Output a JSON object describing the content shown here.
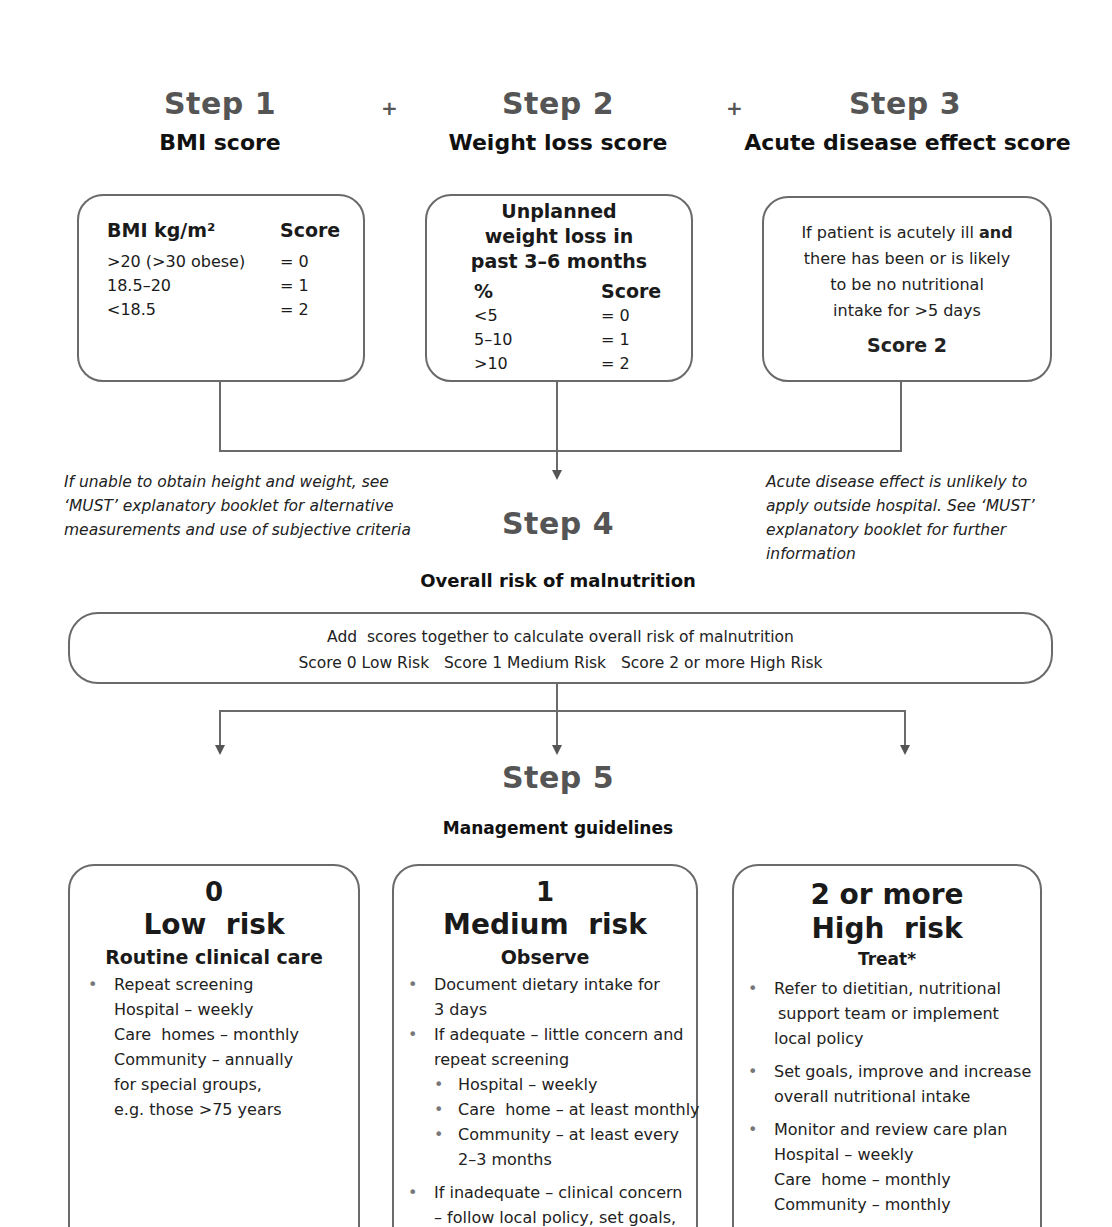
{
  "steps": {
    "step1": {
      "title": "Step 1",
      "subtitle": "BMI score"
    },
    "step2": {
      "title": "Step 2",
      "subtitle": "Weight loss score"
    },
    "step3": {
      "title": "Step 3",
      "subtitle": "Acute disease effect score"
    },
    "step4": {
      "title": "Step 4",
      "subtitle": "Overall risk of malnutrition"
    },
    "step5": {
      "title": "Step 5",
      "subtitle": "Management guidelines"
    },
    "plus": "+"
  },
  "bmi_box": {
    "header_label": "BMI kg/m²",
    "header_score": "Score",
    "rows": [
      {
        "range": ">20 (>30 obese)",
        "score": "= 0"
      },
      {
        "range": "18.5–20",
        "score": "= 1"
      },
      {
        "range": "<18.5",
        "score": "= 2"
      }
    ]
  },
  "weight_box": {
    "title_line1": "Unplanned",
    "title_line2": "weight loss in",
    "title_line3": "past 3–6 months",
    "header_label": "%",
    "header_score": "Score",
    "rows": [
      {
        "range": "<5",
        "score": "= 0"
      },
      {
        "range": "5–10",
        "score": "= 1"
      },
      {
        "range": ">10",
        "score": "= 2"
      }
    ]
  },
  "acute_box": {
    "text_before": "If patient is acutely ill ",
    "text_bold": "and",
    "line2": "there has been or is likely",
    "line3": "to be no nutritional",
    "line4": "intake for >5 days",
    "score": "Score 2"
  },
  "notes": {
    "left": [
      "If unable to obtain height and weight, see",
      "‘MUST’ explanatory booklet for alternative",
      "measurements and use of subjective criteria"
    ],
    "right": [
      "Acute disease effect is unlikely to",
      "apply outside hospital. See ‘MUST’",
      "explanatory booklet for further",
      "information"
    ]
  },
  "overall_box": {
    "line1": "Add  scores together to calculate overall risk of malnutrition",
    "line2": "Score 0 Low Risk   Score 1 Medium Risk   Score 2 or more High Risk"
  },
  "cards": {
    "low": {
      "score": "0",
      "risk": "Low  risk",
      "action": "Routine clinical care",
      "items": [
        "Repeat screening",
        "Hospital – weekly",
        "Care  homes – monthly",
        "Community – annually",
        "for special groups,",
        "e.g. those >75 years"
      ]
    },
    "medium": {
      "score": "1",
      "risk": "Medium  risk",
      "action": "Observe",
      "items": [
        "Document dietary intake for",
        "3 days",
        "If adequate – little concern and",
        "repeat screening",
        "Hospital – weekly",
        "Care  home – at least monthly",
        "Community – at least every",
        "2–3 months",
        "If inadequate – clinical concern",
        "– follow local policy, set goals,"
      ]
    },
    "high": {
      "score": "2 or more",
      "risk": "High  risk",
      "action": "Treat*",
      "items": [
        "Refer to dietitian, nutritional",
        "support team or implement",
        "local policy",
        "Set goals, improve and increase",
        "overall nutritional intake",
        "Monitor and review care plan",
        "Hospital – weekly",
        "Care  home – monthly",
        "Community – monthly"
      ]
    }
  },
  "colors": {
    "line": "#6a6a6a",
    "step_title": "#555555",
    "text": "#1a1a1a"
  }
}
